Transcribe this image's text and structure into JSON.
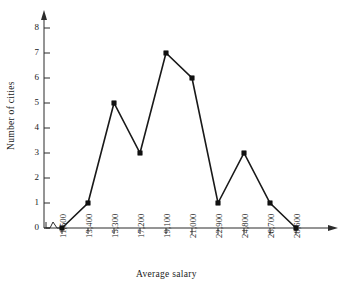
{
  "chart_data": {
    "type": "line",
    "title": "",
    "xlabel": "Average salary",
    "ylabel": "Number of cities",
    "categories": [
      "11,500",
      "13,400",
      "15,300",
      "17,200",
      "19,100",
      "21,000",
      "22,900",
      "24,800",
      "26,700",
      "28,600"
    ],
    "values": [
      0,
      1,
      5,
      3,
      7,
      6,
      1,
      3,
      1,
      0
    ],
    "ylim": [
      0,
      8
    ],
    "ytick_labels": [
      "0",
      "1",
      "2",
      "3",
      "4",
      "5",
      "6",
      "7",
      "8"
    ],
    "ytick_values": [
      0,
      1,
      2,
      3,
      4,
      5,
      6,
      7,
      8
    ],
    "grid": false,
    "legend": false,
    "marker": "filled-square",
    "line_color": "#191919",
    "marker_color": "#111111",
    "axis_color": "#2b2b2b",
    "axis_break": true,
    "x_axis_arrow": true,
    "y_axis_arrow": true,
    "annotations": []
  }
}
